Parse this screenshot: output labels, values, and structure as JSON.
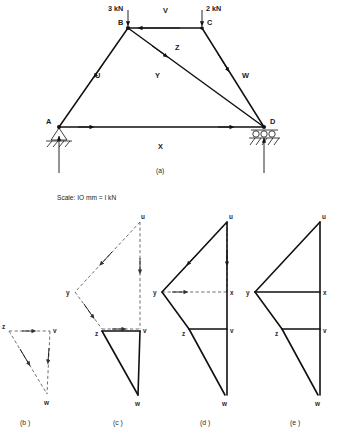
{
  "figure": {
    "title_a": "(a)",
    "scale_note": "Scale: IO mm = I kN",
    "sub_labels": {
      "b": "(b )",
      "c": "(c )",
      "d": "(d )",
      "e": "(e )"
    }
  },
  "truss": {
    "nodes": [
      {
        "id": "A",
        "label": "A",
        "x": 59,
        "y": 127,
        "support": "pinned"
      },
      {
        "id": "B",
        "label": "B",
        "x": 128,
        "y": 28,
        "support": "none"
      },
      {
        "id": "C",
        "label": "C",
        "x": 202,
        "y": 28,
        "support": "none"
      },
      {
        "id": "D",
        "label": "D",
        "x": 264,
        "y": 127,
        "support": "roller"
      }
    ],
    "space_labels": [
      {
        "label": "U",
        "x": 98,
        "y": 75
      },
      {
        "label": "V",
        "x": 165,
        "y": 10
      },
      {
        "label": "W",
        "x": 245,
        "y": 75
      },
      {
        "label": "X",
        "x": 160,
        "y": 146
      },
      {
        "label": "Y",
        "x": 158,
        "y": 75
      },
      {
        "label": "Z",
        "x": 178,
        "y": 47
      }
    ],
    "loads": [
      {
        "label": "3 kN",
        "value": 3,
        "unit": "kN",
        "at_node": "B",
        "direction": "down",
        "text_x": 117,
        "text_y": 9
      },
      {
        "label": "2 kN",
        "value": 2,
        "unit": "kN",
        "at_node": "C",
        "direction": "down",
        "text_x": 208,
        "text_y": 9
      }
    ],
    "reactions": [
      {
        "at_node": "A",
        "direction": "up"
      },
      {
        "at_node": "D",
        "direction": "up"
      }
    ]
  },
  "force_diagrams": {
    "b": {
      "label": "(b )",
      "points": [
        {
          "name": "z",
          "x": 9,
          "y": 331
        },
        {
          "name": "v",
          "x": 50,
          "y": 331
        },
        {
          "name": "w",
          "x": 47,
          "y": 394
        }
      ]
    },
    "c": {
      "label": "(c )",
      "points": [
        {
          "name": "u",
          "x": 140,
          "y": 222
        },
        {
          "name": "y",
          "x": 75,
          "y": 292
        },
        {
          "name": "z",
          "x": 102,
          "y": 329
        },
        {
          "name": "v",
          "x": 140,
          "y": 329
        },
        {
          "name": "w",
          "x": 138,
          "y": 395
        }
      ]
    },
    "d": {
      "label": "(d )",
      "points": [
        {
          "name": "u",
          "x": 227,
          "y": 222
        },
        {
          "name": "y",
          "x": 162,
          "y": 292
        },
        {
          "name": "x",
          "x": 227,
          "y": 292
        },
        {
          "name": "z",
          "x": 189,
          "y": 329
        },
        {
          "name": "v",
          "x": 227,
          "y": 329
        },
        {
          "name": "w",
          "x": 225,
          "y": 395
        }
      ]
    },
    "e": {
      "label": "(e )",
      "points": [
        {
          "name": "u",
          "x": 320,
          "y": 222
        },
        {
          "name": "y",
          "x": 255,
          "y": 292
        },
        {
          "name": "x",
          "x": 320,
          "y": 292
        },
        {
          "name": "z",
          "x": 282,
          "y": 329
        },
        {
          "name": "v",
          "x": 320,
          "y": 329
        },
        {
          "name": "w",
          "x": 318,
          "y": 395
        }
      ]
    }
  },
  "colors": {
    "line": "#111111",
    "dashed": "#555555",
    "text": "#1a1a1a",
    "background": "#ffffff"
  }
}
